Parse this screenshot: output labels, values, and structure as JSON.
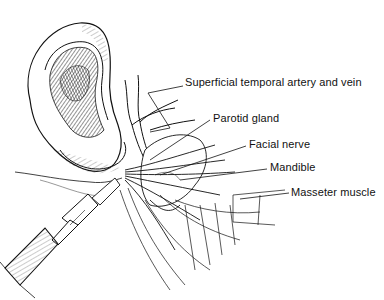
{
  "figure": {
    "labels": [
      {
        "id": "superficial-temporal",
        "text": "Superficial temporal artery and vein",
        "x": 185,
        "y": 81
      },
      {
        "id": "parotid-gland",
        "text": "Parotid gland",
        "x": 213,
        "y": 117
      },
      {
        "id": "facial-nerve",
        "text": "Facial nerve",
        "x": 249,
        "y": 143
      },
      {
        "id": "mandible",
        "text": "Mandible",
        "x": 270,
        "y": 166
      },
      {
        "id": "masseter-muscle",
        "text": "Masseter muscle",
        "x": 291,
        "y": 190
      }
    ],
    "colors": {
      "ink": "#111111",
      "background": "#ffffff"
    }
  }
}
